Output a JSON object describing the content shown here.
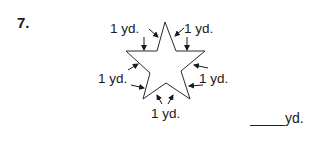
{
  "problem": {
    "number": "7.",
    "figure": "star",
    "side_labels": [
      "1 yd.",
      "1 yd.",
      "1 yd.",
      "1 yd.",
      "1 yd."
    ],
    "answer_blank": "",
    "answer_unit": "yd."
  }
}
